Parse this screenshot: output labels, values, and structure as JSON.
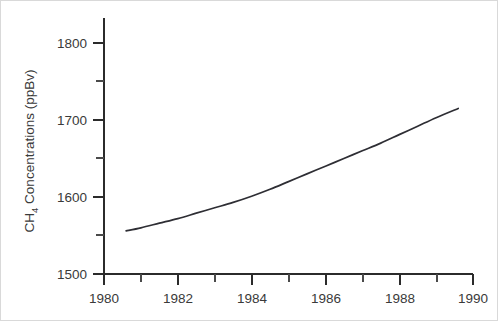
{
  "chart_data": {
    "type": "line",
    "title": "",
    "subtitle": "",
    "xlabel": "",
    "ylabel": "CH4 Concentrations (ppBv)",
    "ylabel_parts": {
      "prefix": "CH",
      "subscript": "4",
      "suffix": " Concentrations (ppBv)"
    },
    "xlim": [
      1980,
      1990
    ],
    "ylim": [
      1500,
      1830
    ],
    "grid": false,
    "legend": null,
    "x_ticks_major": [
      1980,
      1982,
      1984,
      1986,
      1988,
      1990
    ],
    "x_tick_labels": [
      "1980",
      "1982",
      "1984",
      "1986",
      "1988",
      "1990"
    ],
    "x_ticks_minor": [
      1981,
      1983,
      1985,
      1987,
      1989
    ],
    "y_ticks_major": [
      1500,
      1600,
      1700,
      1800
    ],
    "y_tick_labels": [
      "1500",
      "1600",
      "1700",
      "1800"
    ],
    "y_ticks_minor": [
      1550,
      1650,
      1750
    ],
    "series": [
      {
        "name": "CH4 concentration",
        "color": "#2e2e34",
        "x": [
          1980.6,
          1981.0,
          1981.5,
          1982.0,
          1982.5,
          1983.0,
          1983.5,
          1984.0,
          1984.5,
          1985.0,
          1985.5,
          1986.0,
          1986.5,
          1987.0,
          1987.5,
          1988.0,
          1988.5,
          1989.0,
          1989.6
        ],
        "values": [
          1556,
          1560,
          1566,
          1572,
          1579,
          1586,
          1593,
          1601,
          1610,
          1620,
          1630,
          1640,
          1650,
          1660,
          1670,
          1681,
          1692,
          1703,
          1715
        ]
      }
    ],
    "annotations": []
  }
}
